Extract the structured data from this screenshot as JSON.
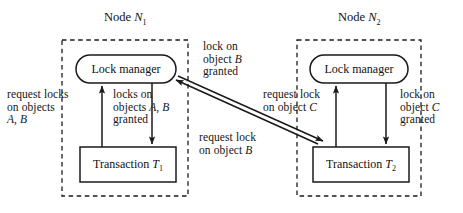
{
  "figure": {
    "background_color": "#ffffff",
    "stroke_color": "#1a1a1a",
    "width": 463,
    "height": 213
  },
  "nodes": [
    {
      "id": "node1",
      "title_prefix": "Node ",
      "title_symbol": "N",
      "title_subscript": "1",
      "lock_manager_label": "Lock manager",
      "transaction_prefix": "Transaction ",
      "transaction_symbol": "T",
      "transaction_subscript": "1"
    },
    {
      "id": "node2",
      "title_prefix": "Node ",
      "title_symbol": "N",
      "title_subscript": "2",
      "lock_manager_label": "Lock manager",
      "transaction_prefix": "Transaction ",
      "transaction_symbol": "T",
      "transaction_subscript": "2"
    }
  ],
  "labels": {
    "request_locks_ab": {
      "line1": "request locks",
      "line2": "on objects",
      "line3_italic": "A, B"
    },
    "locks_ab_granted": {
      "line1": "locks on",
      "line2_prefix": "objects ",
      "line2_italic": "A, B",
      "line3": "granted"
    },
    "lock_b_granted": {
      "line1": "lock on",
      "line2_prefix": "object ",
      "line2_italic": "B",
      "line3": "granted"
    },
    "request_lock_b": {
      "line1": "request lock",
      "line2_prefix": "on object ",
      "line2_italic": "B"
    },
    "request_lock_c": {
      "line1": "request lock",
      "line2_prefix": "on object ",
      "line2_italic": "C"
    },
    "lock_c_granted": {
      "line1": "lock on",
      "line2_prefix": "object ",
      "line2_italic": "C",
      "line3": "granted"
    }
  }
}
